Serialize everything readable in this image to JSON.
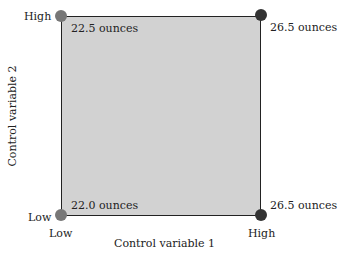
{
  "diagram": {
    "x_axis": {
      "label": "Control variable 1",
      "low": "Low",
      "high": "High"
    },
    "y_axis": {
      "label": "Control variable 2",
      "low": "Low",
      "high": "High"
    },
    "corners": {
      "low_low": {
        "value": "22.0 ounces",
        "color": "#777777"
      },
      "low_high": {
        "value": "22.5 ounces",
        "color": "#777777"
      },
      "high_low": {
        "value": "26.5 ounces",
        "color": "#333333"
      },
      "high_high": {
        "value": "26.5 ounces",
        "color": "#333333"
      }
    },
    "fill_color": "#d2d2d2"
  }
}
